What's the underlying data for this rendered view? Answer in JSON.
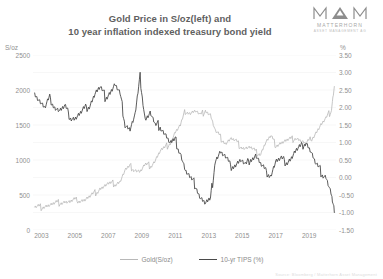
{
  "title": {
    "line1": "Gold Price in S/oz(left) and",
    "line2": "10 year inflation indexed treasury bond yield"
  },
  "logo": {
    "mark": "M△M",
    "name": "MATTERHORN",
    "subtitle": "ASSET MANAGEMENT AG"
  },
  "axes": {
    "left_unit": "S/oz",
    "right_unit": "%"
  },
  "footer": {
    "credit": "Source: Bloomberg / Matterhorn Asset Management"
  },
  "legend": {
    "items": [
      {
        "label": "Gold(S/oz)",
        "color": "#b8b8b8"
      },
      {
        "label": "10-yr TIPS (%)",
        "color": "#4a4a4a"
      }
    ]
  },
  "chart_data": {
    "type": "line",
    "title": "Gold Price in S/oz(left) and 10 year inflation indexed treasury bond yield",
    "xlabel": "",
    "ylabel": "S/oz",
    "y2label": "%",
    "grid": true,
    "legend_position": "bottom",
    "xlim": [
      2002.5,
      2020.6
    ],
    "ylim": [
      0,
      2500
    ],
    "y2lim": [
      -1.5,
      3.5
    ],
    "xticks": [
      "2003",
      "2005",
      "2007",
      "2009",
      "2011",
      "2013",
      "2015",
      "2017",
      "2019"
    ],
    "yticks": [
      "0",
      "500",
      "1000",
      "1500",
      "2000",
      "2500"
    ],
    "y2ticks": [
      "-1.50",
      "-1.00",
      "-0.50",
      "0.00",
      "0.50",
      "1.00",
      "1.50",
      "2.00",
      "2.50",
      "3.00",
      "3.50"
    ],
    "series": [
      {
        "name": "Gold(S/oz)",
        "axis": "left",
        "color": "#b8b8b8",
        "unit": "S/oz",
        "x": [
          2002.6,
          2002.9,
          2003.2,
          2003.5,
          2003.8,
          2004.1,
          2004.4,
          2004.7,
          2005.0,
          2005.3,
          2005.6,
          2005.9,
          2006.2,
          2006.5,
          2006.8,
          2007.1,
          2007.4,
          2007.7,
          2008.0,
          2008.3,
          2008.6,
          2008.9,
          2009.2,
          2009.5,
          2009.8,
          2010.1,
          2010.4,
          2010.7,
          2011.0,
          2011.3,
          2011.6,
          2011.9,
          2012.2,
          2012.5,
          2012.8,
          2013.1,
          2013.4,
          2013.7,
          2014.0,
          2014.3,
          2014.6,
          2014.9,
          2015.2,
          2015.5,
          2015.8,
          2016.1,
          2016.4,
          2016.7,
          2017.0,
          2017.3,
          2017.6,
          2017.9,
          2018.2,
          2018.5,
          2018.8,
          2019.1,
          2019.4,
          2019.7,
          2020.0,
          2020.3,
          2020.5
        ],
        "values": [
          315,
          325,
          350,
          355,
          370,
          400,
          410,
          395,
          425,
          430,
          435,
          470,
          520,
          600,
          630,
          650,
          665,
          700,
          840,
          900,
          870,
          830,
          920,
          920,
          1000,
          1120,
          1170,
          1250,
          1400,
          1480,
          1700,
          1680,
          1700,
          1620,
          1720,
          1650,
          1400,
          1320,
          1250,
          1300,
          1260,
          1200,
          1180,
          1170,
          1110,
          1100,
          1250,
          1330,
          1220,
          1250,
          1270,
          1290,
          1330,
          1280,
          1220,
          1300,
          1400,
          1500,
          1580,
          1700,
          2050
        ]
      },
      {
        "name": "10-yr TIPS (%)",
        "axis": "right",
        "color": "#4a4a4a",
        "unit": "%",
        "x": [
          2002.6,
          2002.9,
          2003.2,
          2003.5,
          2003.8,
          2004.1,
          2004.4,
          2004.7,
          2005.0,
          2005.3,
          2005.6,
          2005.9,
          2006.2,
          2006.5,
          2006.8,
          2007.1,
          2007.4,
          2007.7,
          2008.0,
          2008.3,
          2008.6,
          2008.9,
          2009.2,
          2009.5,
          2009.8,
          2010.1,
          2010.4,
          2010.7,
          2011.0,
          2011.3,
          2011.6,
          2011.9,
          2012.2,
          2012.5,
          2012.8,
          2013.1,
          2013.4,
          2013.7,
          2014.0,
          2014.3,
          2014.6,
          2014.9,
          2015.2,
          2015.5,
          2015.8,
          2016.1,
          2016.4,
          2016.7,
          2017.0,
          2017.3,
          2017.6,
          2017.9,
          2018.2,
          2018.5,
          2018.8,
          2019.1,
          2019.4,
          2019.7,
          2020.0,
          2020.3,
          2020.5
        ],
        "values": [
          2.45,
          2.2,
          1.95,
          2.25,
          2.05,
          1.9,
          2.0,
          1.75,
          1.7,
          1.8,
          1.95,
          2.1,
          2.4,
          2.55,
          2.3,
          2.45,
          2.65,
          2.35,
          1.55,
          1.4,
          1.75,
          2.85,
          1.7,
          1.85,
          1.45,
          1.5,
          1.25,
          0.95,
          1.05,
          0.75,
          0.2,
          -0.05,
          -0.2,
          -0.55,
          -0.75,
          -0.65,
          0.55,
          0.75,
          0.55,
          0.3,
          0.4,
          0.5,
          0.3,
          0.55,
          0.65,
          0.35,
          0.15,
          0.1,
          0.45,
          0.5,
          0.45,
          0.55,
          0.75,
          0.85,
          1.05,
          0.75,
          0.35,
          0.15,
          0.05,
          -0.45,
          -1.0
        ]
      }
    ]
  }
}
